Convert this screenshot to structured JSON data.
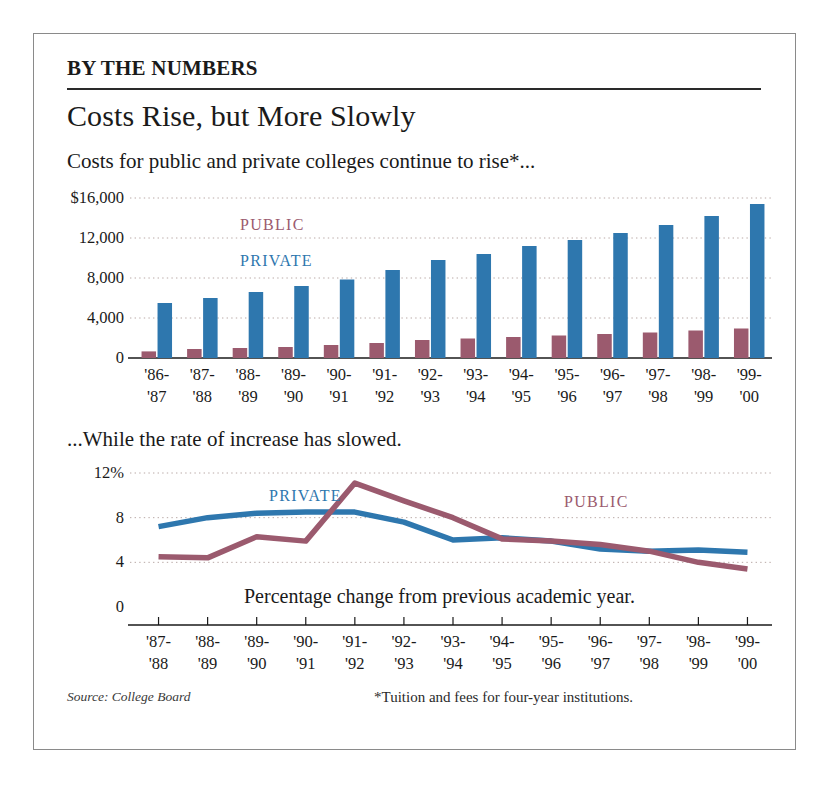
{
  "kicker": "BY THE NUMBERS",
  "headline": "Costs Rise, but More Slowly",
  "deck": "Costs for public and private colleges continue to rise*...",
  "mid_caption": "...While the rate of increase has slowed.",
  "source": "Source: College Board",
  "footnote": "*Tuition and fees for four-year institutions.",
  "colors": {
    "public": "#9b5a6e",
    "private": "#2e77ae",
    "grid": "#b9a9a6",
    "axis": "#1a1a1a"
  },
  "chart_data": [
    {
      "type": "bar",
      "title": "Costs for public and private colleges continue to rise*...",
      "xlabel": "",
      "ylabel": "",
      "ylim": [
        0,
        16000
      ],
      "yticks": [
        0,
        4000,
        8000,
        12000,
        16000
      ],
      "ytick_labels": [
        "0",
        "4,000",
        "8,000",
        "12,000",
        "$16,000"
      ],
      "grid": true,
      "legend": [
        "PUBLIC",
        "PRIVATE"
      ],
      "legend_position": "inside-top",
      "categories": [
        "'86-\n'87",
        "'87-\n'88",
        "'88-\n'89",
        "'89-\n'90",
        "'90-\n'91",
        "'91-\n'92",
        "'92-\n'93",
        "'93-\n'94",
        "'94-\n'95",
        "'95-\n'96",
        "'96-\n'97",
        "'97-\n'98",
        "'98-\n'99",
        "'99-\n'00"
      ],
      "categories_top": [
        "'86-",
        "'87-",
        "'88-",
        "'89-",
        "'90-",
        "'91-",
        "'92-",
        "'93-",
        "'94-",
        "'95-",
        "'96-",
        "'97-",
        "'98-",
        "'99-"
      ],
      "categories_bottom": [
        "'87",
        "'88",
        "'89",
        "'90",
        "'91",
        "'92",
        "'93",
        "'94",
        "'95",
        "'96",
        "'97",
        "'98",
        "'99",
        "'00"
      ],
      "series": [
        {
          "name": "PUBLIC",
          "color": "#9b5a6e",
          "values": [
            660,
            900,
            1000,
            1100,
            1300,
            1500,
            1800,
            1950,
            2100,
            2250,
            2400,
            2550,
            2750,
            2950
          ]
        },
        {
          "name": "PRIVATE",
          "color": "#2e77ae",
          "values": [
            5500,
            6000,
            6600,
            7200,
            7850,
            8800,
            9800,
            10400,
            11200,
            11800,
            12500,
            13300,
            14200,
            15400
          ]
        }
      ]
    },
    {
      "type": "line",
      "title": "...While the rate of increase has slowed.",
      "xlabel": "",
      "ylabel": "",
      "ylim": [
        0,
        12
      ],
      "yticks": [
        0,
        4,
        8,
        12
      ],
      "ytick_labels": [
        "0",
        "4",
        "8",
        "12%"
      ],
      "grid": true,
      "legend": [
        "PRIVATE",
        "PUBLIC"
      ],
      "legend_position": "inside",
      "annotation": "Percentage change from previous academic year.",
      "categories_top": [
        "'87-",
        "'88-",
        "'89-",
        "'90-",
        "'91-",
        "'92-",
        "'93-",
        "'94-",
        "'95-",
        "'96-",
        "'97-",
        "'98-",
        "'99-"
      ],
      "categories_bottom": [
        "'88",
        "'89",
        "'90",
        "'91",
        "'92",
        "'93",
        "'94",
        "'95",
        "'96",
        "'97",
        "'98",
        "'99",
        "'00"
      ],
      "series": [
        {
          "name": "PRIVATE",
          "color": "#2e77ae",
          "values": [
            7.2,
            8.0,
            8.4,
            8.5,
            8.5,
            7.6,
            6.0,
            6.2,
            5.9,
            5.2,
            5.0,
            5.1,
            4.9
          ]
        },
        {
          "name": "PUBLIC",
          "color": "#9b5a6e",
          "values": [
            4.5,
            4.4,
            6.3,
            5.9,
            11.1,
            9.5,
            8.0,
            6.1,
            5.9,
            5.6,
            5.0,
            4.0,
            3.4
          ]
        }
      ]
    }
  ]
}
